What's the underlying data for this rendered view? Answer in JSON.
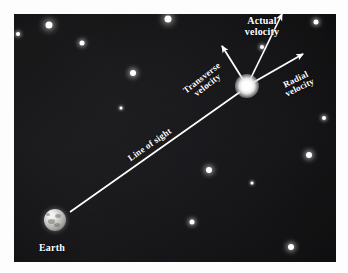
{
  "figure": {
    "background_color": "#070707",
    "frame_color": "#fdfdfd",
    "line_color": "#ffffff"
  },
  "labels": {
    "earth": "Earth",
    "line_of_sight": "Line of sight",
    "transverse_velocity": "Transverse\nvelocity",
    "actual_velocity": "Actual\nvelocity",
    "radial_velocity": "Radial\nvelocity"
  },
  "chart_data": {
    "type": "diagram",
    "objects": [
      {
        "name": "Earth",
        "label": "Earth",
        "x": 55,
        "y": 220,
        "diameter": 22
      },
      {
        "name": "star",
        "label": "",
        "x": 247,
        "y": 86,
        "diameter": 11
      }
    ],
    "vectors": [
      {
        "name": "line-of-sight",
        "label": "Line of sight",
        "from": [
          70,
          212
        ],
        "to": [
          240,
          92
        ],
        "arrowhead": false,
        "label_x": 150,
        "label_y": 145,
        "label_rotation": -35
      },
      {
        "name": "transverse-velocity",
        "label": "Transverse velocity",
        "from": [
          247,
          86
        ],
        "to": [
          222,
          46
        ],
        "arrowhead": true,
        "label_x": 205,
        "label_y": 82,
        "label_rotation": -38
      },
      {
        "name": "actual-velocity",
        "label": "Actual velocity",
        "from": [
          247,
          86
        ],
        "to": [
          282,
          14
        ],
        "arrowhead": true,
        "label_x": 262,
        "label_y": 26,
        "label_rotation": 0
      },
      {
        "name": "radial-velocity",
        "label": "Radial velocity",
        "from": [
          247,
          86
        ],
        "to": [
          303,
          54
        ],
        "arrowhead": true,
        "label_x": 298,
        "label_y": 84,
        "label_rotation": -26
      }
    ],
    "stars": [
      {
        "x": 49,
        "y": 25,
        "size": 7
      },
      {
        "x": 18,
        "y": 34,
        "size": 4
      },
      {
        "x": 82,
        "y": 43,
        "size": 5
      },
      {
        "x": 133,
        "y": 73,
        "size": 6
      },
      {
        "x": 168,
        "y": 19,
        "size": 7
      },
      {
        "x": 316,
        "y": 22,
        "size": 5
      },
      {
        "x": 262,
        "y": 47,
        "size": 4
      },
      {
        "x": 209,
        "y": 170,
        "size": 6
      },
      {
        "x": 252,
        "y": 183,
        "size": 3
      },
      {
        "x": 309,
        "y": 155,
        "size": 6
      },
      {
        "x": 192,
        "y": 222,
        "size": 5
      },
      {
        "x": 291,
        "y": 247,
        "size": 6
      },
      {
        "x": 121,
        "y": 108,
        "size": 3
      },
      {
        "x": 324,
        "y": 118,
        "size": 4
      }
    ],
    "axis_ranges": {
      "x": [
        14,
        336
      ],
      "y": [
        14,
        262
      ]
    },
    "grid": false,
    "legend": "none"
  }
}
